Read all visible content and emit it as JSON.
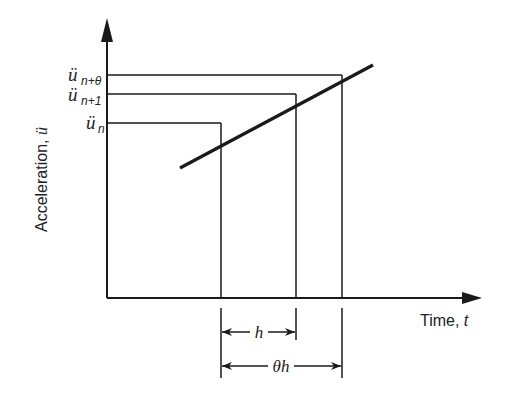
{
  "diagram": {
    "type": "linear acceleration assumption (Wilson-theta method)",
    "y_axis": {
      "label": "Acceleration, ",
      "symbol": "ü"
    },
    "x_axis": {
      "label": "Time, ",
      "symbol": "t"
    },
    "levels": [
      {
        "id": "u_n_theta",
        "base": "ü",
        "sub": "n+θ"
      },
      {
        "id": "u_n1",
        "base": "ü",
        "sub": "n+1"
      },
      {
        "id": "u_n",
        "base": "ü",
        "sub": "n"
      }
    ],
    "dimensions": [
      {
        "id": "h",
        "label": "h"
      },
      {
        "id": "theta_h",
        "label": "θh"
      }
    ],
    "colors": {
      "line": "#1a1a1a",
      "background": "#ffffff"
    }
  }
}
